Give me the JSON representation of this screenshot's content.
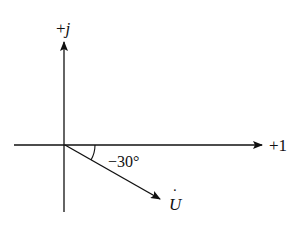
{
  "diagram": {
    "type": "phasor-diagram",
    "axes": {
      "real_label": "+1",
      "imag_label_sign": "+",
      "imag_label_symbol": "j"
    },
    "phasor": {
      "label_symbol": "U",
      "label_dot": "˙",
      "angle_label": "−30°",
      "angle_deg": -30
    },
    "colors": {
      "stroke": "#111111",
      "background": "#ffffff"
    }
  }
}
